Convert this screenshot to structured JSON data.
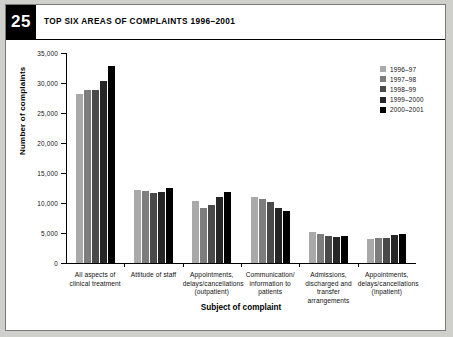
{
  "figure": {
    "number": "25",
    "title": "TOP SIX AREAS OF COMPLAINTS 1996–2001"
  },
  "chart_data": {
    "type": "bar",
    "title": "TOP SIX AREAS OF COMPLAINTS 1996–2001",
    "xlabel": "Subject of complaint",
    "ylabel": "Number of complaints",
    "ylim": [
      0,
      35000
    ],
    "ytick_step": 5000,
    "ytick_labels": [
      "0",
      "5,000",
      "10,000",
      "15,000",
      "20,000",
      "25,000",
      "30,000",
      "35,000"
    ],
    "grid": false,
    "legend_position": "top-right",
    "categories": [
      "All aspects of clinical treatment",
      "Attitude of staff",
      "Appointments, delays/cancellations (outpatient)",
      "Communication/ information to patients",
      "Admissions, discharged and transfer arrangements",
      "Appointments, delays/cancellations (inpatient)"
    ],
    "series": [
      {
        "name": "1996–97",
        "color": "#a9a9a9",
        "values": [
          28200,
          12100,
          10300,
          11000,
          5200,
          4000
        ]
      },
      {
        "name": "1997–98",
        "color": "#7d7d7d",
        "values": [
          28800,
          12000,
          9200,
          10700,
          4800,
          4100
        ]
      },
      {
        "name": "1998–99",
        "color": "#4a4a4a",
        "values": [
          28800,
          11700,
          9700,
          10200,
          4500,
          4200
        ]
      },
      {
        "name": "1999–2000",
        "color": "#262626",
        "values": [
          30400,
          11900,
          11000,
          9100,
          4400,
          4600
        ]
      },
      {
        "name": "2000–2001",
        "color": "#000000",
        "values": [
          32900,
          12500,
          11800,
          8600,
          4500,
          4900
        ]
      }
    ]
  }
}
